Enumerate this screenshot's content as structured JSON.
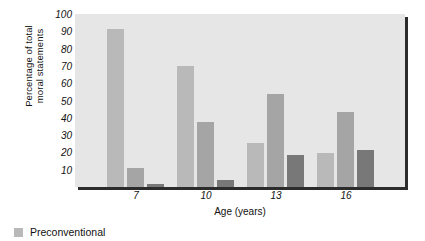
{
  "chart_data": {
    "type": "bar",
    "title": "",
    "subtitle": "",
    "xlabel": "Age (years)",
    "ylabel": "Percentage of total moral statements",
    "ylabel_lines": [
      "Percentage of total",
      "moral statements"
    ],
    "categories": [
      "7",
      "10",
      "13",
      "16"
    ],
    "ylim": [
      0,
      100
    ],
    "yticks": [
      10,
      20,
      30,
      40,
      50,
      60,
      70,
      80,
      90,
      100
    ],
    "grid": false,
    "legend_position": "below-left",
    "series": [
      {
        "name": "Preconventional",
        "color": "#b9b9b9",
        "values": [
          93,
          71,
          26,
          20
        ]
      },
      {
        "name": "",
        "color": "#a5a5a5",
        "values": [
          11,
          38,
          55,
          44
        ]
      },
      {
        "name": "",
        "color": "#787878",
        "values": [
          2,
          4,
          19,
          22
        ]
      }
    ],
    "plot_background": "#e6e6e6",
    "annotations": []
  },
  "legend": {
    "items": [
      {
        "label": "Preconventional",
        "color": "#b9b9b9"
      }
    ]
  }
}
